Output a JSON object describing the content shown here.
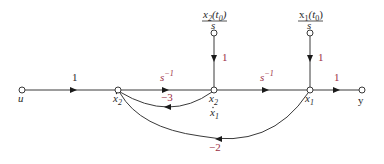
{
  "diagram": {
    "type": "signal-flow-graph",
    "colors": {
      "line": "#3a3a3a",
      "text": "#2a2a2a",
      "gain_accent": "#9b2f45",
      "background": "#ffffff"
    },
    "nodes": [
      {
        "id": "u",
        "label": "u",
        "x": 22,
        "y": 90
      },
      {
        "id": "x2dot",
        "label": "ẋ₂",
        "x": 118,
        "y": 90
      },
      {
        "id": "x2",
        "label": "x₂",
        "sublabel": "ẋ₁",
        "x": 214,
        "y": 90
      },
      {
        "id": "x1",
        "label": "x₁",
        "x": 310,
        "y": 90
      },
      {
        "id": "y",
        "label": "y",
        "x": 362,
        "y": 90
      },
      {
        "id": "ic2",
        "label": "x₂(t₀)/s",
        "x": 214,
        "y": 33
      },
      {
        "id": "ic1",
        "label": "x₁(t₀)/s",
        "x": 310,
        "y": 33
      }
    ],
    "labels": {
      "u": "u",
      "x2dot_base": "x",
      "x2dot_sub": "2",
      "x2_base": "x",
      "x2_sub": "2",
      "x1dot_base": "x",
      "x1dot_sub": "1",
      "x1_base": "x",
      "x1_sub": "1",
      "y": "y",
      "ic2_num_base": "x",
      "ic2_num_sub": "2",
      "ic2_num_arg": "(t",
      "ic2_num_arg_sub": "0",
      "ic2_num_close": ")",
      "ic2_den": "s",
      "ic1_num_base": "x",
      "ic1_num_sub": "1",
      "ic1_num_arg": "(t",
      "ic1_num_arg_sub": "0",
      "ic1_num_close": ")",
      "ic1_den": "s"
    },
    "edges": [
      {
        "from": "u",
        "to": "x2dot",
        "gain": "1"
      },
      {
        "from": "x2dot",
        "to": "x2",
        "gain": "s⁻¹",
        "gain_base": "s",
        "gain_exp": "−1"
      },
      {
        "from": "x2",
        "to": "x1",
        "gain": "s⁻¹",
        "gain_base": "s",
        "gain_exp": "−1"
      },
      {
        "from": "x1",
        "to": "y",
        "gain": "1"
      },
      {
        "from": "ic2",
        "to": "x2",
        "gain": "1"
      },
      {
        "from": "ic1",
        "to": "x1",
        "gain": "1"
      },
      {
        "from": "x2",
        "to": "x2dot",
        "gain": "−3"
      },
      {
        "from": "x1",
        "to": "x2dot",
        "gain": "−2"
      }
    ]
  }
}
